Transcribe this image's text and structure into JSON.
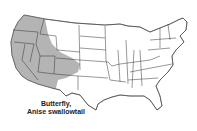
{
  "map": {
    "region": "United States (contiguous)",
    "shaded_states": [
      "Washington",
      "Oregon",
      "California",
      "Idaho",
      "Nevada",
      "Utah",
      "Arizona",
      "Western Montana",
      "Western Wyoming",
      "Western Colorado",
      "Northwestern New Mexico"
    ],
    "shade_color": "#b4b4b4",
    "border_color": "#333333"
  },
  "caption": {
    "line1": "Butterfly,",
    "line2": "Anise swallowtail"
  }
}
